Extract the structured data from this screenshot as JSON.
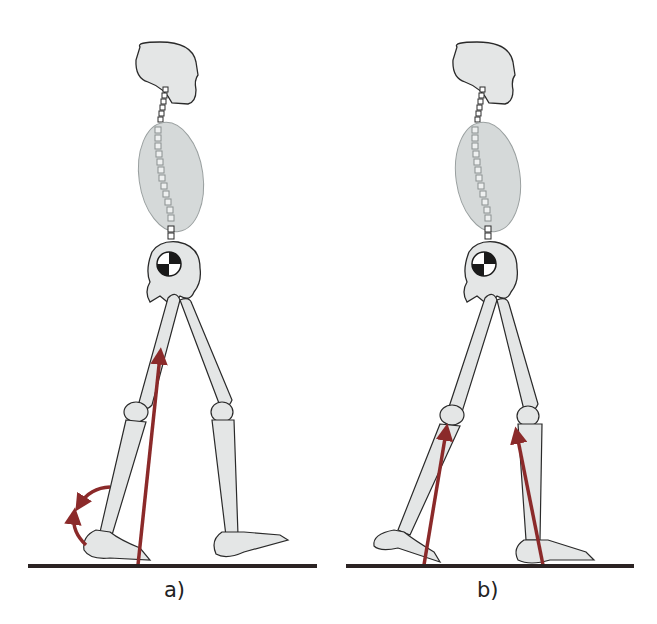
{
  "figure": {
    "panels": [
      {
        "id": "a",
        "label": "a)",
        "description": "Heel-strike: ground reaction force vector from heel up toward hip; curved arrows indicating ankle rotation"
      },
      {
        "id": "b",
        "label": "b)",
        "description": "Double support: ground reaction forces from both feet directed toward knees"
      }
    ],
    "colors": {
      "bone_fill": "#e4e6e6",
      "bone_stroke": "#2a2a2a",
      "trunk_fill": "#d5d9d9",
      "force_arrow": "#8b2a2a",
      "ground": "#2b2323",
      "background": "#ffffff"
    },
    "icons": [
      "center-of-mass-icon",
      "force-vector-arrow",
      "rotation-arrow"
    ]
  }
}
